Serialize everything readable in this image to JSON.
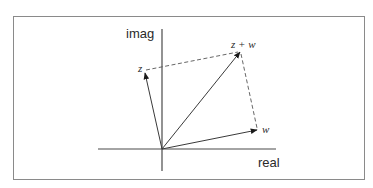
{
  "diagram": {
    "axes": {
      "x_label": "real",
      "y_label": "imag"
    },
    "vectors": [
      {
        "id": "z",
        "label": "z",
        "from": [
          162,
          149
        ],
        "to": [
          145,
          73
        ],
        "style": "solid"
      },
      {
        "id": "w",
        "label": "w",
        "from": [
          162,
          149
        ],
        "to": [
          257,
          130
        ],
        "style": "solid"
      },
      {
        "id": "zw",
        "label": "z + w",
        "from": [
          162,
          149
        ],
        "to": [
          240,
          52
        ],
        "style": "solid"
      }
    ],
    "dashed_lines": [
      {
        "id": "z-to-sum",
        "from": [
          146,
          70
        ],
        "to": [
          238,
          52
        ]
      },
      {
        "id": "w-to-sum",
        "from": [
          241,
          54
        ],
        "to": [
          257,
          128
        ]
      }
    ],
    "colors": {
      "stroke": "#3a3a3a",
      "border": "#8a8a8a",
      "text": "#2a2a2a"
    }
  }
}
